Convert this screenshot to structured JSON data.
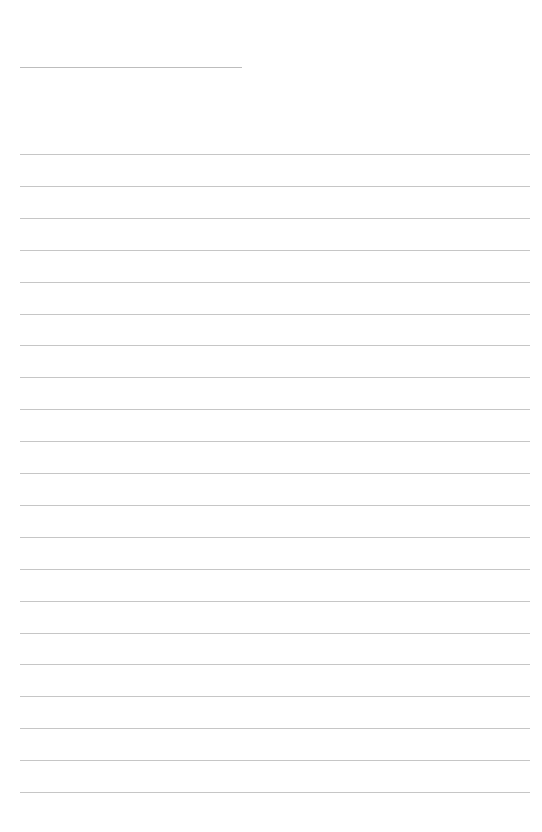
{
  "document": {
    "type": "lined-paper",
    "background_color": "#ffffff",
    "line_color": "#c6c6c6",
    "title_line": {
      "x_start": 20,
      "x_end": 242,
      "y": 67
    },
    "ruled_lines": {
      "count": 21,
      "x_start": 20,
      "x_end": 530,
      "first_y": 154,
      "spacing": 31.9
    }
  }
}
